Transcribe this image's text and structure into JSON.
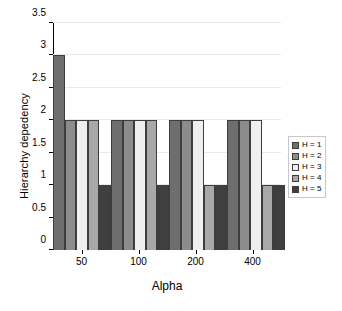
{
  "chart_data": {
    "type": "bar",
    "title": "",
    "xlabel": "Alpha",
    "ylabel": "Hierarchy depedency",
    "categories": [
      "50",
      "100",
      "200",
      "400"
    ],
    "ylim": [
      0,
      3.5
    ],
    "yticks": [
      "0",
      "0.5",
      "1",
      "1.5",
      "2",
      "2.5",
      "3",
      "3.5"
    ],
    "ytick_values": [
      0,
      0.5,
      1,
      1.5,
      2,
      2.5,
      3,
      3.5
    ],
    "grid": true,
    "legend_position": "right",
    "series": [
      {
        "name": "H = 1",
        "color": "#6e6e6e",
        "values": [
          3,
          2,
          2,
          2
        ]
      },
      {
        "name": "H = 2",
        "color": "#8c8c8c",
        "values": [
          2,
          2,
          2,
          2
        ]
      },
      {
        "name": "H = 3",
        "color": "#efefef",
        "values": [
          2,
          2,
          2,
          2
        ]
      },
      {
        "name": "H = 4",
        "color": "#a8a8a8",
        "values": [
          2,
          2,
          1,
          1
        ]
      },
      {
        "name": "H = 5",
        "color": "#3f3f3f",
        "values": [
          1,
          1,
          1,
          1
        ]
      }
    ]
  }
}
